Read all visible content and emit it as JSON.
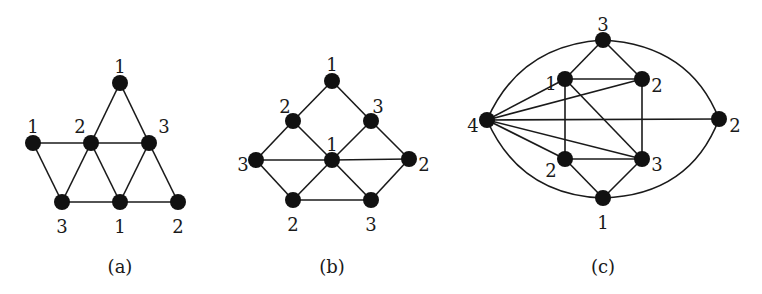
{
  "figure": {
    "node_radius": 8,
    "colors": {
      "node": "#111111",
      "edge": "#1a1a1a",
      "background": "#ffffff"
    },
    "graphs": [
      {
        "id": "a",
        "caption": "(a)",
        "caption_pos": [
          120,
          268
        ],
        "nodes": [
          {
            "id": "t",
            "x": 120,
            "y": 83,
            "label": "1",
            "lx": 120,
            "ly": 68
          },
          {
            "id": "l",
            "x": 33,
            "y": 143,
            "label": "1",
            "lx": 33,
            "ly": 128
          },
          {
            "id": "m",
            "x": 91,
            "y": 143,
            "label": "2",
            "lx": 80,
            "ly": 128
          },
          {
            "id": "r",
            "x": 149,
            "y": 143,
            "label": "3",
            "lx": 164,
            "ly": 128
          },
          {
            "id": "bl",
            "x": 62,
            "y": 202,
            "label": "3",
            "lx": 62,
            "ly": 228
          },
          {
            "id": "bm",
            "x": 120,
            "y": 202,
            "label": "1",
            "lx": 120,
            "ly": 228
          },
          {
            "id": "br",
            "x": 178,
            "y": 202,
            "label": "2",
            "lx": 178,
            "ly": 228
          }
        ],
        "edges": [
          [
            "t",
            "m"
          ],
          [
            "t",
            "r"
          ],
          [
            "l",
            "m"
          ],
          [
            "m",
            "r"
          ],
          [
            "l",
            "bl"
          ],
          [
            "m",
            "bl"
          ],
          [
            "m",
            "bm"
          ],
          [
            "r",
            "bm"
          ],
          [
            "r",
            "br"
          ],
          [
            "bl",
            "bm"
          ],
          [
            "bm",
            "br"
          ]
        ],
        "arcs": []
      },
      {
        "id": "b",
        "caption": "(b)",
        "caption_pos": [
          332,
          268
        ],
        "nodes": [
          {
            "id": "t",
            "x": 332,
            "y": 81,
            "label": "1",
            "lx": 332,
            "ly": 66
          },
          {
            "id": "ul",
            "x": 293,
            "y": 121,
            "label": "2",
            "lx": 285,
            "ly": 108
          },
          {
            "id": "ur",
            "x": 371,
            "y": 121,
            "label": "3",
            "lx": 378,
            "ly": 108
          },
          {
            "id": "l",
            "x": 256,
            "y": 160,
            "label": "3",
            "lx": 243,
            "ly": 166
          },
          {
            "id": "c",
            "x": 332,
            "y": 160,
            "label": "1",
            "lx": 332,
            "ly": 146
          },
          {
            "id": "r",
            "x": 409,
            "y": 159,
            "label": "2",
            "lx": 424,
            "ly": 166
          },
          {
            "id": "bl",
            "x": 293,
            "y": 200,
            "label": "2",
            "lx": 293,
            "ly": 226
          },
          {
            "id": "br",
            "x": 371,
            "y": 200,
            "label": "3",
            "lx": 371,
            "ly": 226
          }
        ],
        "edges": [
          [
            "t",
            "ul"
          ],
          [
            "t",
            "ur"
          ],
          [
            "ul",
            "l"
          ],
          [
            "ul",
            "c"
          ],
          [
            "ur",
            "c"
          ],
          [
            "ur",
            "r"
          ],
          [
            "l",
            "c"
          ],
          [
            "c",
            "r"
          ],
          [
            "l",
            "bl"
          ],
          [
            "c",
            "bl"
          ],
          [
            "c",
            "br"
          ],
          [
            "r",
            "br"
          ],
          [
            "bl",
            "br"
          ]
        ],
        "arcs": []
      },
      {
        "id": "c",
        "caption": "(c)",
        "caption_pos": [
          603,
          268
        ],
        "nodes": [
          {
            "id": "t",
            "x": 603,
            "y": 40,
            "label": "3",
            "lx": 603,
            "ly": 26
          },
          {
            "id": "ul",
            "x": 565,
            "y": 79,
            "label": "1",
            "lx": 551,
            "ly": 85
          },
          {
            "id": "ur",
            "x": 642,
            "y": 79,
            "label": "2",
            "lx": 657,
            "ly": 87
          },
          {
            "id": "l",
            "x": 487,
            "y": 120,
            "label": "4",
            "lx": 473,
            "ly": 127
          },
          {
            "id": "r",
            "x": 719,
            "y": 119,
            "label": "2",
            "lx": 735,
            "ly": 127
          },
          {
            "id": "ll",
            "x": 565,
            "y": 159,
            "label": "2",
            "lx": 551,
            "ly": 172
          },
          {
            "id": "lr",
            "x": 642,
            "y": 159,
            "label": "3",
            "lx": 657,
            "ly": 166
          },
          {
            "id": "b",
            "x": 603,
            "y": 198,
            "label": "1",
            "lx": 603,
            "ly": 224
          }
        ],
        "edges": [
          [
            "t",
            "ul"
          ],
          [
            "t",
            "ur"
          ],
          [
            "ul",
            "ur"
          ],
          [
            "l",
            "ul"
          ],
          [
            "l",
            "ur"
          ],
          [
            "l",
            "r"
          ],
          [
            "l",
            "ll"
          ],
          [
            "l",
            "lr"
          ],
          [
            "ul",
            "ll"
          ],
          [
            "ur",
            "lr"
          ],
          [
            "ul",
            "lr"
          ],
          [
            "ll",
            "lr"
          ],
          [
            "ll",
            "b"
          ],
          [
            "lr",
            "b"
          ]
        ],
        "arcs": [
          {
            "from": "l",
            "to": "t",
            "cx": 520,
            "cy": 45
          },
          {
            "from": "t",
            "to": "r",
            "cx": 690,
            "cy": 45
          },
          {
            "from": "l",
            "to": "b",
            "cx": 520,
            "cy": 195
          },
          {
            "from": "b",
            "to": "r",
            "cx": 690,
            "cy": 195
          }
        ]
      }
    ]
  }
}
